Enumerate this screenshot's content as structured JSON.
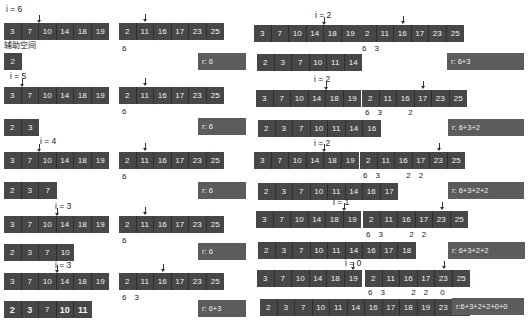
{
  "caption_aux": "辅助空间",
  "steps": [
    {
      "i": "i = 6",
      "A": [
        "3",
        "7",
        "10",
        "14",
        "18",
        "19"
      ],
      "B": [
        "2",
        "11",
        "16",
        "17",
        "23",
        "25"
      ],
      "counts": [
        "6"
      ],
      "aux": [
        "2"
      ],
      "r": "r: 6"
    },
    {
      "i": "i = 5",
      "A": [
        "3",
        "7",
        "10",
        "14",
        "18",
        "19"
      ],
      "B": [
        "2",
        "11",
        "16",
        "17",
        "23",
        "25"
      ],
      "counts": [
        "6"
      ],
      "aux": [
        "2",
        "3"
      ],
      "r": "r: 6"
    },
    {
      "i": "i = 4",
      "A": [
        "3",
        "7",
        "10",
        "14",
        "18",
        "19"
      ],
      "B": [
        "2",
        "11",
        "16",
        "17",
        "23",
        "25"
      ],
      "counts": [
        "6"
      ],
      "aux": [
        "2",
        "3",
        "7"
      ],
      "r": "r: 6"
    },
    {
      "i": "i = 3",
      "A": [
        "3",
        "7",
        "10",
        "14",
        "18",
        "19"
      ],
      "B": [
        "2",
        "11",
        "16",
        "17",
        "23",
        "25"
      ],
      "counts": [
        "6"
      ],
      "aux": [
        "2",
        "3",
        "7",
        "10"
      ],
      "r": "r: 6"
    },
    {
      "i": "i = 3",
      "A": [
        "3",
        "7",
        "10",
        "14",
        "18",
        "19"
      ],
      "B": [
        "2",
        "11",
        "16",
        "17",
        "23",
        "25"
      ],
      "counts": [
        "6",
        "3"
      ],
      "aux": [
        "2",
        "3",
        "7",
        "10",
        "11"
      ],
      "r": "r: 6+3"
    },
    {
      "i": "i = 2",
      "A": [
        "3",
        "7",
        "10",
        "14",
        "18",
        "19"
      ],
      "B": [
        "2",
        "11",
        "16",
        "17",
        "23",
        "25"
      ],
      "counts": [
        "6",
        "3"
      ],
      "aux": [
        "2",
        "3",
        "7",
        "10",
        "11",
        "14"
      ],
      "r": "r: 6+3"
    },
    {
      "i": "i = 2",
      "A": [
        "3",
        "7",
        "10",
        "14",
        "18",
        "19"
      ],
      "B": [
        "2",
        "11",
        "16",
        "17",
        "23",
        "25"
      ],
      "counts": [
        "6",
        "3",
        "2"
      ],
      "aux": [
        "2",
        "3",
        "7",
        "10",
        "11",
        "14",
        "16"
      ],
      "r": "r: 6+3+2"
    },
    {
      "i": "i = 2",
      "A": [
        "3",
        "7",
        "10",
        "14",
        "18",
        "19"
      ],
      "B": [
        "2",
        "11",
        "16",
        "17",
        "23",
        "25"
      ],
      "counts": [
        "6",
        "3",
        "2",
        "2"
      ],
      "aux": [
        "2",
        "3",
        "7",
        "10",
        "11",
        "14",
        "16",
        "17"
      ],
      "r": "r: 6+3+2+2"
    },
    {
      "i": "i = 1",
      "A": [
        "3",
        "7",
        "10",
        "14",
        "18",
        "19"
      ],
      "B": [
        "2",
        "11",
        "16",
        "17",
        "23",
        "25"
      ],
      "counts": [
        "6",
        "3",
        "2",
        "2"
      ],
      "aux": [
        "2",
        "3",
        "7",
        "10",
        "11",
        "14",
        "16",
        "17",
        "18"
      ],
      "r": "r: 6+3+2+2"
    },
    {
      "i": "i = 0",
      "A": [
        "3",
        "7",
        "10",
        "14",
        "18",
        "19"
      ],
      "B": [
        "2",
        "11",
        "16",
        "17",
        "23",
        "25"
      ],
      "counts": [
        "6",
        "3",
        "2",
        "2",
        "0"
      ],
      "aux": [
        "2",
        "3",
        "7",
        "10",
        "11",
        "14",
        "16",
        "17",
        "18",
        "19",
        "23",
        "25"
      ],
      "r": "r:6+3+2+2+0+0"
    }
  ]
}
